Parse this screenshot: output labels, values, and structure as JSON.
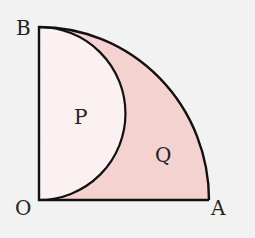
{
  "diagram": {
    "labels": {
      "B": "B",
      "O": "O",
      "A": "A",
      "P": "P",
      "Q": "Q"
    },
    "colors": {
      "background": "#f2f2f2",
      "region_P": "#fbf1f0",
      "region_Q": "#f3d2cf",
      "stroke": "#111111"
    }
  }
}
